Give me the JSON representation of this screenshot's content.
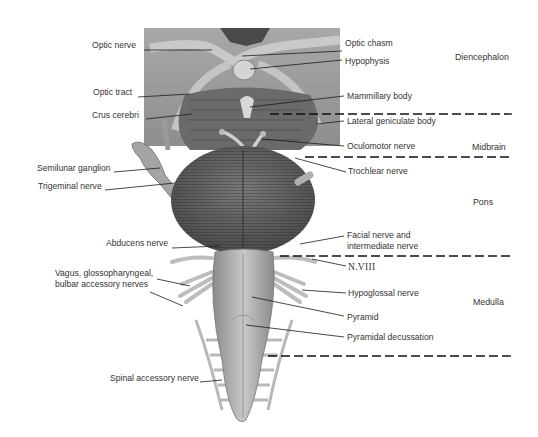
{
  "figure": {
    "colors": {
      "background": "#ffffff",
      "illustration_gray": "#9a9a9a",
      "leader_line": "#1a1a1a",
      "text": "#333333"
    }
  },
  "regions": [
    {
      "name": "Diencephalon",
      "x": 455,
      "y": 54
    },
    {
      "name": "Midbrain",
      "x": 472,
      "y": 143
    },
    {
      "name": "Pons",
      "x": 473,
      "y": 198
    },
    {
      "name": "Medulla",
      "x": 473,
      "y": 298
    }
  ],
  "dividers": [
    {
      "x1": 270,
      "x2": 512,
      "y": 114
    },
    {
      "x1": 305,
      "x2": 512,
      "y": 157
    },
    {
      "x1": 280,
      "x2": 512,
      "y": 256
    },
    {
      "x1": 268,
      "x2": 512,
      "y": 356
    }
  ],
  "labels_left": [
    {
      "text": "Optic nerve",
      "x": 92,
      "y": 45,
      "line": [
        144,
        50,
        212,
        50
      ]
    },
    {
      "text": "Optic tract",
      "x": 93,
      "y": 92,
      "line": [
        138,
        97,
        190,
        94
      ]
    },
    {
      "text": "Crus cerebri",
      "x": 92,
      "y": 115,
      "line": [
        146,
        119,
        192,
        114
      ]
    },
    {
      "text": "Semilunar ganglion",
      "x": 37,
      "y": 168,
      "line": [
        114,
        172,
        160,
        168
      ]
    },
    {
      "text": "Trigeminal nerve",
      "x": 38,
      "y": 186,
      "line": [
        105,
        190,
        175,
        183
      ]
    },
    {
      "text": "Abducens nerve",
      "x": 106,
      "y": 243,
      "line": [
        172,
        248,
        220,
        246
      ]
    },
    {
      "text": "Vagus, glossopharyngeal,",
      "x": 55,
      "y": 273,
      "line": [
        157,
        279,
        190,
        286
      ]
    },
    {
      "text": "bulbar accessory nerves",
      "x": 55,
      "y": 284,
      "line": [
        150,
        292,
        183,
        306
      ]
    },
    {
      "text": "Spinal accessory nerve",
      "x": 110,
      "y": 378,
      "line": [
        200,
        382,
        222,
        380
      ]
    }
  ],
  "labels_right": [
    {
      "text": "Optic chasm",
      "x": 345,
      "y": 40,
      "line": [
        242,
        56,
        342,
        51
      ]
    },
    {
      "text": "Hypophysis",
      "x": 345,
      "y": 57,
      "line": [
        250,
        69,
        342,
        60
      ]
    },
    {
      "text": "Mammillary body",
      "x": 347,
      "y": 91,
      "line": [
        250,
        107,
        344,
        96
      ]
    },
    {
      "text": "Lateral geniculate body",
      "x": 347,
      "y": 116,
      "line": [
        316,
        124,
        344,
        121
      ]
    },
    {
      "text": "Oculomotor nerve",
      "x": 347,
      "y": 142,
      "line": [
        262,
        139,
        344,
        146
      ]
    },
    {
      "text": "Trochlear nerve",
      "x": 348,
      "y": 166,
      "line": [
        295,
        158,
        346,
        172
      ]
    },
    {
      "text": "Facial nerve and",
      "x": 347,
      "y": 230,
      "line": [
        300,
        244,
        344,
        236
      ]
    },
    {
      "text": "intermediate nerve",
      "x": 347,
      "y": 240,
      "line": null
    },
    {
      "text": "N.VIII",
      "x": 348,
      "y": 262,
      "line": [
        312,
        259,
        346,
        266
      ],
      "serif": true
    },
    {
      "text": "Hypoglossal nerve",
      "x": 348,
      "y": 288,
      "line": [
        302,
        290,
        346,
        293
      ]
    },
    {
      "text": "Pyramid",
      "x": 347,
      "y": 312,
      "line": [
        252,
        297,
        344,
        316
      ]
    },
    {
      "text": "Pyramidal decussation",
      "x": 347,
      "y": 332,
      "line": [
        246,
        325,
        344,
        337
      ]
    }
  ]
}
